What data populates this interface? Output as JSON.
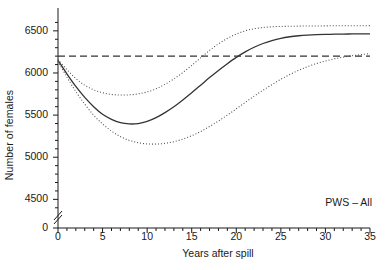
{
  "chart_data": {
    "type": "line",
    "title": "",
    "xlabel": "Years after spill",
    "ylabel": "Number of females",
    "xlim": [
      0,
      35
    ],
    "ylim": [
      4350,
      6700
    ],
    "grid": false,
    "legend": null,
    "annotation": "PWS – All",
    "axis_break": {
      "axis": "y",
      "note": "broken y-axis between 0 and 4350",
      "symbol": "//"
    },
    "xticks": [
      0,
      5,
      10,
      15,
      20,
      25,
      30,
      35
    ],
    "xticklabels": [
      "0",
      "5",
      "10",
      "15",
      "20",
      "25",
      "30",
      "35"
    ],
    "xminor_step": 1,
    "yticks": [
      0,
      4500,
      5000,
      5500,
      6000,
      6500
    ],
    "yticklabels": [
      "0",
      "4500",
      "5000",
      "5500",
      "6000",
      "6500"
    ],
    "yminor_step": 100,
    "reference_line": {
      "name": "pre-spill baseline",
      "orientation": "horizontal",
      "y": 6200,
      "style": "dashed",
      "color": "#333333"
    },
    "x": [
      0,
      1,
      2,
      3,
      4,
      5,
      6,
      7,
      8,
      9,
      10,
      11,
      12,
      13,
      14,
      15,
      16,
      17,
      18,
      19,
      20,
      21,
      22,
      23,
      24,
      25,
      26,
      27,
      28,
      29,
      30,
      31,
      32,
      33,
      34,
      35
    ],
    "series": [
      {
        "name": "Median projection",
        "style": "solid",
        "color": "#333333",
        "values": [
          6150,
          5990,
          5840,
          5710,
          5600,
          5510,
          5450,
          5410,
          5395,
          5400,
          5425,
          5470,
          5530,
          5600,
          5680,
          5765,
          5855,
          5945,
          6030,
          6110,
          6185,
          6250,
          6305,
          6350,
          6385,
          6412,
          6430,
          6442,
          6450,
          6455,
          6458,
          6460,
          6462,
          6463,
          6464,
          6465
        ]
      },
      {
        "name": "Upper confidence bound",
        "style": "dotted",
        "color": "#4d4d4d",
        "values": [
          6160,
          6040,
          5935,
          5855,
          5800,
          5765,
          5745,
          5738,
          5740,
          5752,
          5775,
          5812,
          5865,
          5930,
          6005,
          6090,
          6180,
          6268,
          6345,
          6410,
          6462,
          6500,
          6525,
          6540,
          6548,
          6552,
          6554,
          6556,
          6557,
          6558,
          6559,
          6560,
          6560,
          6561,
          6561,
          6562
        ]
      },
      {
        "name": "Lower confidence bound",
        "style": "dotted",
        "color": "#4d4d4d",
        "values": [
          6140,
          5950,
          5780,
          5630,
          5500,
          5395,
          5310,
          5245,
          5200,
          5172,
          5158,
          5156,
          5165,
          5185,
          5215,
          5255,
          5305,
          5365,
          5430,
          5500,
          5575,
          5650,
          5725,
          5795,
          5862,
          5925,
          5982,
          6032,
          6075,
          6112,
          6142,
          6168,
          6188,
          6205,
          6218,
          6230
        ]
      }
    ]
  }
}
